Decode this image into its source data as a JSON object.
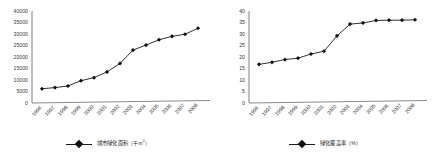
{
  "chart_data": [
    {
      "id": "urban-green-area",
      "type": "line",
      "title": "",
      "xlabel": "",
      "ylabel": "",
      "legend_position": "bottom",
      "grid": false,
      "legend": [
        "城市绿化面积（千m2）"
      ],
      "legend_text_main": "城市绿化面积",
      "legend_text_unit": "（千m",
      "legend_text_sup": "2",
      "legend_text_tail": "）",
      "categories": [
        "1996",
        "1997",
        "1998",
        "1999",
        "2000",
        "2001",
        "2002",
        "2003",
        "2004",
        "2005",
        "2006",
        "2007",
        "2008"
      ],
      "x": [
        "1996",
        "1997",
        "1998",
        "1999",
        "2000",
        "2001",
        "2002",
        "2003",
        "2004",
        "2005",
        "2006",
        "2007",
        "2008"
      ],
      "values": [
        6200,
        6700,
        7400,
        9700,
        11000,
        13500,
        17200,
        23000,
        25200,
        27500,
        29000,
        29900,
        32500
      ],
      "ylim": [
        0,
        40000
      ],
      "yticks": [
        0,
        5000,
        10000,
        15000,
        20000,
        25000,
        30000,
        35000,
        40000
      ],
      "ytick_labels": [
        "0",
        "5000",
        "10000",
        "15000",
        "20000",
        "25000",
        "30000",
        "35000",
        "40000"
      ],
      "marker": "diamond",
      "line_color": "#1a1a1a",
      "marker_color": "#111111"
    },
    {
      "id": "green-coverage-rate",
      "type": "line",
      "title": "",
      "xlabel": "",
      "ylabel": "",
      "legend_position": "bottom",
      "grid": false,
      "legend": [
        "绿化覆盖率（%）"
      ],
      "legend_text_main": "绿化覆盖率",
      "legend_text_unit": "（%）",
      "legend_text_sup": "",
      "legend_text_tail": "",
      "categories": [
        "1996",
        "1997",
        "1998",
        "1999",
        "2000",
        "2001",
        "2002",
        "2003",
        "2004",
        "2005",
        "2006",
        "2007",
        "2008"
      ],
      "x": [
        "1996",
        "1997",
        "1998",
        "1999",
        "2000",
        "2001",
        "2002",
        "2003",
        "2004",
        "2005",
        "2006",
        "2007",
        "2008"
      ],
      "values": [
        16.8,
        17.7,
        18.9,
        19.5,
        21.3,
        22.5,
        29.2,
        34.3,
        34.8,
        35.9,
        36.0,
        36.0,
        36.2
      ],
      "ylim": [
        0,
        40
      ],
      "yticks": [
        0,
        5,
        10,
        15,
        20,
        25,
        30,
        35,
        40
      ],
      "ytick_labels": [
        "0",
        "5",
        "10",
        "15",
        "20",
        "25",
        "30",
        "35",
        "40"
      ],
      "marker": "diamond",
      "line_color": "#1a1a1a",
      "marker_color": "#111111"
    }
  ],
  "colors": {
    "background": "#ffffff",
    "axis": "#8a8a8a",
    "line": "#1a1a1a",
    "marker": "#111111",
    "text": "#3a3a3a"
  }
}
